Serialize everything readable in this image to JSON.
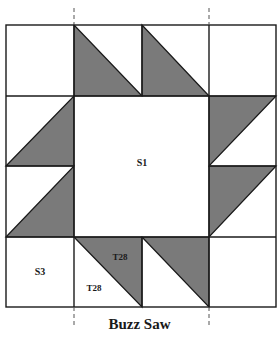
{
  "diagram": {
    "title": "Buzz Saw",
    "grid": {
      "cols": 4,
      "rows": 4
    },
    "colors": {
      "shaded": "#7a7a7a",
      "line": "#1a1a1a",
      "background": "#ffffff"
    },
    "labels": {
      "center": "S1",
      "corner_square": "S3",
      "triangle_dark": "T28",
      "triangle_light": "T28"
    },
    "cells": [
      {
        "row": 0,
        "col": 1,
        "shape": "half-square-triangle",
        "shaded": "bottom-left"
      },
      {
        "row": 0,
        "col": 2,
        "shape": "half-square-triangle",
        "shaded": "bottom-left"
      },
      {
        "row": 1,
        "col": 0,
        "shape": "half-square-triangle",
        "shaded": "bottom-right"
      },
      {
        "row": 2,
        "col": 0,
        "shape": "half-square-triangle",
        "shaded": "bottom-right"
      },
      {
        "row": 1,
        "col": 3,
        "shape": "half-square-triangle",
        "shaded": "top-left"
      },
      {
        "row": 2,
        "col": 3,
        "shape": "half-square-triangle",
        "shaded": "top-left"
      },
      {
        "row": 3,
        "col": 1,
        "shape": "half-square-triangle",
        "shaded": "top-right"
      },
      {
        "row": 3,
        "col": 2,
        "shape": "half-square-triangle",
        "shaded": "top-right"
      },
      {
        "row": 1,
        "col": 1,
        "shape": "square",
        "span": 2,
        "label": "S1"
      },
      {
        "row": 3,
        "col": 0,
        "shape": "square",
        "label": "S3"
      }
    ]
  }
}
